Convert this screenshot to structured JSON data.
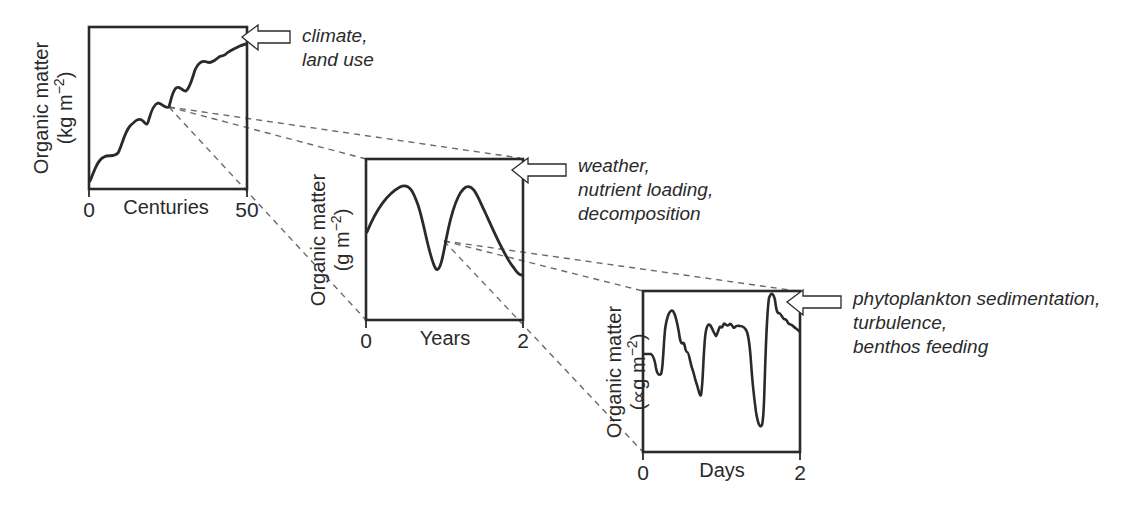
{
  "colors": {
    "ink": "#2a2a2a",
    "dashed": "#6a6a6a",
    "background": "#ffffff"
  },
  "panels": [
    {
      "id": "centuries",
      "y_label_line1": "Organic matter",
      "y_label_line2_prefix": "(kg m",
      "y_label_sup": "−2",
      "y_label_line2_suffix": ")",
      "x_label": "Centuries",
      "x_tick_start": "0",
      "x_tick_end": "50",
      "drivers": [
        "climate,",
        "land use"
      ],
      "arrow_icon": "hollow-left-arrow"
    },
    {
      "id": "years",
      "y_label_line1": "Organic matter",
      "y_label_line2_prefix": "(g m",
      "y_label_sup": "−2",
      "y_label_line2_suffix": ")",
      "x_label": "Years",
      "x_tick_start": "0",
      "x_tick_end": "2",
      "drivers": [
        "weather,",
        "nutrient loading,",
        "decomposition"
      ],
      "arrow_icon": "hollow-left-arrow"
    },
    {
      "id": "days",
      "y_label_line1": "Organic matter",
      "y_label_line2_prefix": "(∝g m",
      "y_label_sup": "−2",
      "y_label_line2_suffix": ")",
      "x_label": "Days",
      "x_tick_start": "0",
      "x_tick_end": "2",
      "drivers": [
        "phytoplankton sedimentation,",
        "turbulence,",
        "benthos feeding"
      ],
      "arrow_icon": "hollow-left-arrow"
    }
  ]
}
